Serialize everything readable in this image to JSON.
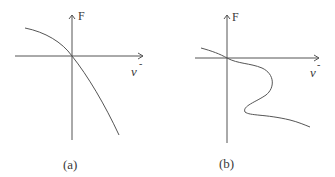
{
  "figure": {
    "panels": [
      {
        "id": "a",
        "caption": "(a)",
        "y_axis_label": "F",
        "x_axis_label": "v",
        "x_axis_superscript": "-",
        "curve_description": "monotonically decreasing concave curve through origin"
      },
      {
        "id": "b",
        "caption": "(b)",
        "y_axis_label": "F",
        "x_axis_label": "v",
        "x_axis_superscript": "-",
        "curve_description": "decreasing S-shaped (multivalued) curve through origin"
      }
    ],
    "colors": {
      "line": "#555555",
      "text": "#3a3a3a",
      "background": "#ffffff"
    }
  }
}
